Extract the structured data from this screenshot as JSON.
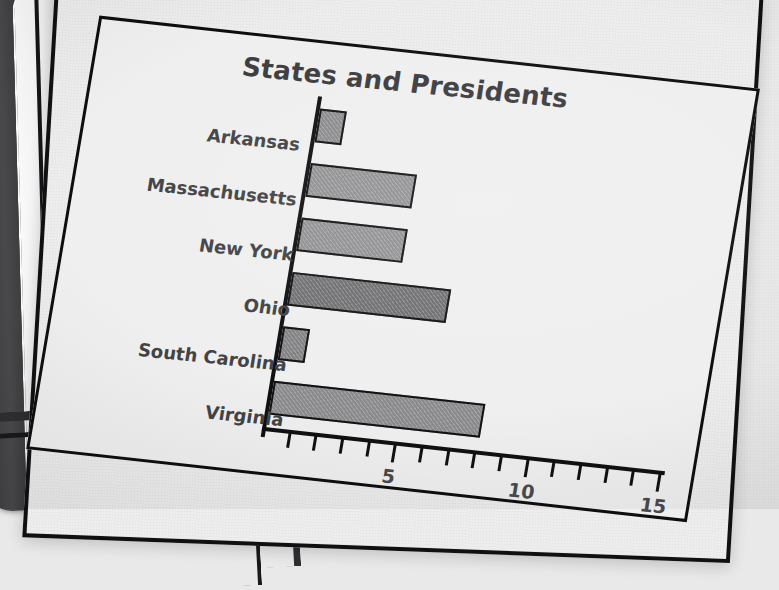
{
  "scene": {
    "medium": "photograph-of-printed-page",
    "page_background": "#eeeeef",
    "binding_color": "#3a3a3c",
    "frame_color": "#101012"
  },
  "chart_data": {
    "type": "bar",
    "orientation": "horizontal",
    "title": "States and Presidents",
    "xlabel": "",
    "ylabel": "",
    "categories": [
      "Arkansas",
      "Massachusetts",
      "New York",
      "Ohio",
      "South Carolina",
      "Virginia"
    ],
    "values": [
      1,
      4,
      4,
      6,
      1,
      8
    ],
    "xlim": [
      0,
      15
    ],
    "xtick_step": 1,
    "xtick_labels": [
      "5",
      "10",
      "15"
    ],
    "xtick_label_values": [
      5,
      10,
      15
    ],
    "grid": false,
    "legend": false,
    "bar_colors": [
      "#8a8a8c",
      "#909092",
      "#909092",
      "#6f6f71",
      "#828284",
      "#8b8b8d"
    ],
    "bar_outline": "#121214",
    "title_color": "#3c3c3e",
    "label_color": "#434345"
  }
}
